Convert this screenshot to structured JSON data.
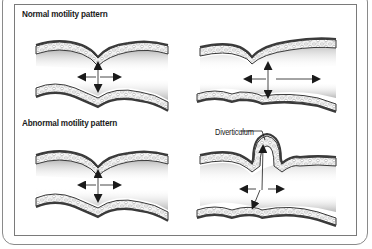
{
  "diagram": {
    "labels": {
      "normal": "Normal motility pattern",
      "abnormal": "Abnormal motility pattern",
      "diverticulum": "Diverticulum"
    },
    "panels": [
      {
        "id": "normal-segmenting",
        "section": "normal",
        "position": "top-left",
        "arrows": [
          "up",
          "down",
          "left",
          "right"
        ]
      },
      {
        "id": "normal-propulsive",
        "section": "normal",
        "position": "top-right",
        "arrows": [
          "up",
          "down",
          "left",
          "right-long"
        ]
      },
      {
        "id": "abnormal-segmenting",
        "section": "abnormal",
        "position": "bottom-left",
        "arrows": [
          "up",
          "down",
          "left",
          "right"
        ]
      },
      {
        "id": "abnormal-diverticulum",
        "section": "abnormal",
        "position": "bottom-right",
        "arrows": [
          "up-into-pouch",
          "down-left",
          "left",
          "right"
        ],
        "callout": "Diverticulum"
      }
    ],
    "colors": {
      "frame": "#8a8a8a",
      "wall_outline": "#3a3a3a",
      "wall_fill": "#e6e6e6",
      "shade": "#9a9a9a",
      "arrow": "#1a1a1a"
    }
  }
}
